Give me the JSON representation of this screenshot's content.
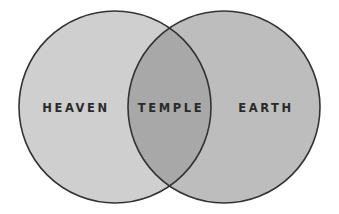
{
  "diagram": {
    "type": "venn",
    "sets": [
      {
        "id": "heaven",
        "label": "HEAVEN",
        "fill": "#cfcfcf"
      },
      {
        "id": "earth",
        "label": "EARTH",
        "fill": "#bdbdbd"
      }
    ],
    "intersection": {
      "label": "TEMPLE",
      "fill": "#a8a8a8"
    },
    "stroke": "#333333"
  }
}
